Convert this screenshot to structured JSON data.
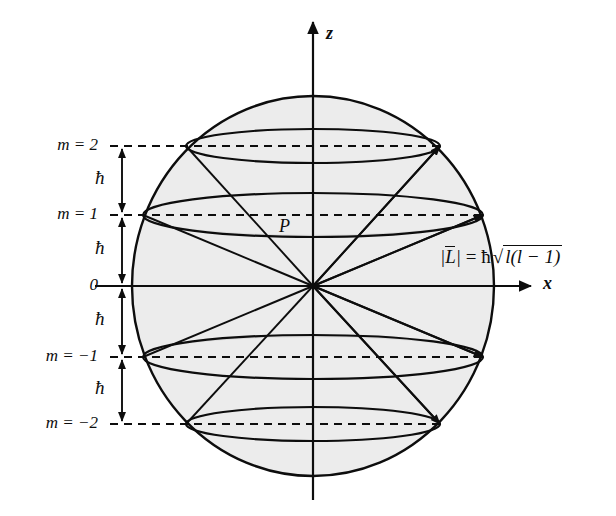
{
  "figure": {
    "background_color": "#ffffff",
    "ink_color": "#0d0d0d",
    "sphere_fill": "#ececec",
    "cone_fill": "#d8d8d8"
  },
  "axes": {
    "vertical": {
      "label": "z",
      "x": 313,
      "tip_y": 22,
      "base_y": 500
    },
    "horizontal": {
      "label": "x",
      "y": 286,
      "start_x": 95,
      "tip_x": 531
    }
  },
  "sphere": {
    "center_x": 313,
    "center_y": 286,
    "radius_x": 181,
    "radius_y": 190
  },
  "origin_label": "0",
  "point_label": "P",
  "spacing_label": "ħ",
  "formula": {
    "magnitude": "L",
    "equals": "=",
    "hbar": "ħ",
    "radicand": "l(l − 1)"
  },
  "levels": [
    {
      "m_label": "m = 2",
      "m_value": 2,
      "y": 146,
      "half_width": 127,
      "ellipse_ry": 17,
      "cone_apex_visible": true
    },
    {
      "m_label": "m = 1",
      "m_value": 1,
      "y": 215,
      "half_width": 170,
      "ellipse_ry": 22,
      "cone_apex_visible": true
    },
    {
      "m_label": "0",
      "m_value": 0,
      "y": 286,
      "half_width": 181,
      "ellipse_ry": 0,
      "cone_apex_visible": false
    },
    {
      "m_label": "m = −1",
      "m_value": -1,
      "y": 357,
      "half_width": 170,
      "ellipse_ry": 22,
      "cone_apex_visible": true
    },
    {
      "m_label": "m = −2",
      "m_value": -2,
      "y": 424,
      "half_width": 127,
      "ellipse_ry": 17,
      "cone_apex_visible": true
    }
  ],
  "spacing_markers": [
    {
      "label": "ħ",
      "top_y": 146,
      "bottom_y": 215,
      "label_y": 180
    },
    {
      "label": "ħ",
      "top_y": 215,
      "bottom_y": 286,
      "label_y": 250
    },
    {
      "label": "ħ",
      "top_y": 286,
      "bottom_y": 357,
      "label_y": 321
    },
    {
      "label": "ħ",
      "top_y": 357,
      "bottom_y": 424,
      "label_y": 390
    }
  ]
}
